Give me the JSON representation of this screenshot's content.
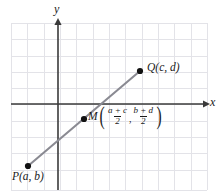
{
  "figure": {
    "background_color": "#ffffff",
    "grid_color": "#e3e3e8",
    "axis_color": "#3a3a3a",
    "segment_color": "#8a8a92",
    "point_color": "#111111",
    "text_color": "#1a1a1a"
  },
  "axes": {
    "y_label": "y",
    "x_label": "x",
    "x_axis_y": 104,
    "y_axis_x": 58
  },
  "grid": {
    "left": 11,
    "top": 23,
    "right": 207,
    "bottom": 190,
    "cell_size": 16.3,
    "columns": 12,
    "rows": 10
  },
  "points": [
    {
      "name": "P",
      "label": "P(a, b)",
      "label_parts": {
        "name": "P",
        "coords": "(a, b)"
      },
      "x": 28,
      "y": 166
    },
    {
      "name": "Q",
      "label": "Q(c, d)",
      "label_parts": {
        "name": "Q",
        "coords": "(c, d)"
      },
      "x": 140,
      "y": 71
    },
    {
      "name": "M",
      "label": "M((a + c)/2, (b + d)/2)",
      "x": 84,
      "y": 119
    }
  ],
  "midpoint_label": {
    "name": "M",
    "open_paren": "(",
    "close_paren": ")",
    "comma": ",",
    "fraction_x": {
      "numerator": "a + c",
      "denominator": "2"
    },
    "fraction_y": {
      "numerator": "b + d",
      "denominator": "2"
    }
  },
  "segment": {
    "from": "P",
    "to": "Q",
    "x1": 28,
    "y1": 166,
    "x2": 140,
    "y2": 71
  }
}
